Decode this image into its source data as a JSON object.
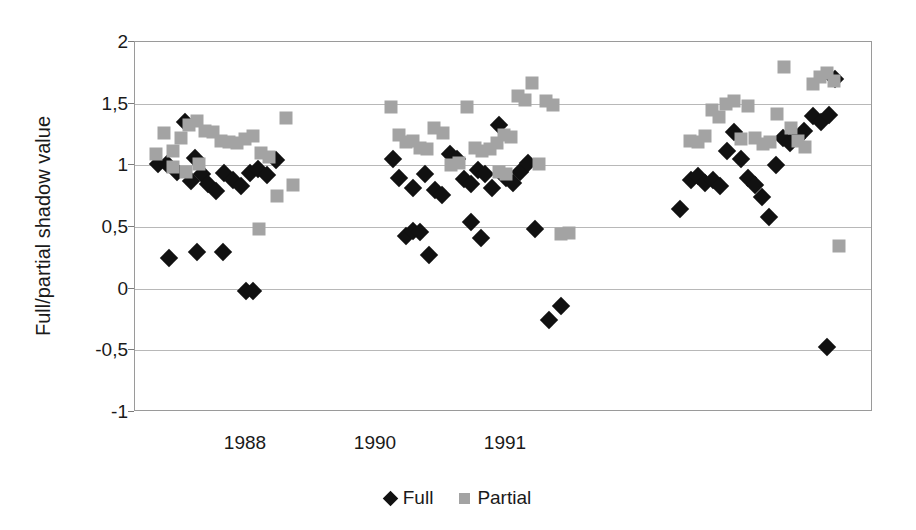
{
  "chart_data": {
    "type": "scatter",
    "title": "",
    "xlabel": "",
    "ylabel": "Full/partial shadow value",
    "ylim": [
      -1,
      2
    ],
    "ytick_labels": [
      "2",
      "1,5",
      "1",
      "0,5",
      "0",
      "-0,5",
      "-1"
    ],
    "ytick_values": [
      2,
      1.5,
      1,
      0.5,
      0,
      -0.5,
      -1
    ],
    "xtick_labels": [
      "1988",
      "1990",
      "1991"
    ],
    "xtick_positions": [
      245,
      375,
      505
    ],
    "grid": true,
    "legend_position": "bottom-center",
    "series": [
      {
        "name": "Full",
        "marker": "diamond",
        "color": "#111111",
        "points": [
          [
            157,
            1.01
          ],
          [
            166,
            1.01
          ],
          [
            176,
            0.95
          ],
          [
            184,
            1.35
          ],
          [
            190,
            0.87
          ],
          [
            194,
            1.06
          ],
          [
            201,
            0.93
          ],
          [
            207,
            0.85
          ],
          [
            215,
            0.79
          ],
          [
            223,
            0.94
          ],
          [
            232,
            0.88
          ],
          [
            240,
            0.83
          ],
          [
            249,
            0.94
          ],
          [
            257,
            0.97
          ],
          [
            266,
            0.92
          ],
          [
            275,
            1.04
          ],
          [
            168,
            0.25
          ],
          [
            196,
            0.3
          ],
          [
            222,
            0.3
          ],
          [
            245,
            -0.02
          ],
          [
            252,
            -0.02
          ],
          [
            392,
            1.05
          ],
          [
            398,
            0.9
          ],
          [
            412,
            0.82
          ],
          [
            424,
            0.93
          ],
          [
            434,
            0.8
          ],
          [
            441,
            0.76
          ],
          [
            449,
            1.09
          ],
          [
            456,
            1.05
          ],
          [
            463,
            0.89
          ],
          [
            470,
            0.85
          ],
          [
            477,
            0.96
          ],
          [
            484,
            0.93
          ],
          [
            491,
            0.82
          ],
          [
            498,
            1.33
          ],
          [
            505,
            0.9
          ],
          [
            512,
            0.86
          ],
          [
            519,
            0.95
          ],
          [
            527,
            1.02
          ],
          [
            534,
            0.48
          ],
          [
            405,
            0.43
          ],
          [
            412,
            0.47
          ],
          [
            419,
            0.46
          ],
          [
            428,
            0.27
          ],
          [
            470,
            0.54
          ],
          [
            480,
            0.41
          ],
          [
            548,
            -0.25
          ],
          [
            560,
            -0.14
          ],
          [
            679,
            0.65
          ],
          [
            690,
            0.88
          ],
          [
            697,
            0.91
          ],
          [
            704,
            0.86
          ],
          [
            712,
            0.88
          ],
          [
            719,
            0.83
          ],
          [
            726,
            1.12
          ],
          [
            733,
            1.27
          ],
          [
            740,
            1.05
          ],
          [
            747,
            0.9
          ],
          [
            754,
            0.84
          ],
          [
            761,
            0.74
          ],
          [
            768,
            0.58
          ],
          [
            775,
            1.0
          ],
          [
            782,
            1.22
          ],
          [
            789,
            1.18
          ],
          [
            796,
            1.22
          ],
          [
            803,
            1.28
          ],
          [
            812,
            1.4
          ],
          [
            820,
            1.35
          ],
          [
            828,
            1.41
          ],
          [
            834,
            1.7
          ],
          [
            826,
            -0.47
          ]
        ]
      },
      {
        "name": "Partial",
        "marker": "square",
        "color": "#a3a3a3",
        "points": [
          [
            155,
            1.09
          ],
          [
            163,
            1.26
          ],
          [
            172,
            1.12
          ],
          [
            180,
            1.22
          ],
          [
            188,
            1.33
          ],
          [
            196,
            1.36
          ],
          [
            204,
            1.28
          ],
          [
            212,
            1.27
          ],
          [
            220,
            1.2
          ],
          [
            228,
            1.19
          ],
          [
            236,
            1.18
          ],
          [
            244,
            1.21
          ],
          [
            252,
            1.24
          ],
          [
            260,
            1.1
          ],
          [
            268,
            1.07
          ],
          [
            276,
            0.75
          ],
          [
            172,
            0.99
          ],
          [
            185,
            0.95
          ],
          [
            198,
            1.01
          ],
          [
            285,
            1.38
          ],
          [
            292,
            0.84
          ],
          [
            258,
            0.48
          ],
          [
            390,
            1.47
          ],
          [
            398,
            1.25
          ],
          [
            405,
            1.19
          ],
          [
            412,
            1.2
          ],
          [
            419,
            1.14
          ],
          [
            426,
            1.13
          ],
          [
            433,
            1.3
          ],
          [
            442,
            1.26
          ],
          [
            450,
            1.0
          ],
          [
            458,
            1.02
          ],
          [
            466,
            1.47
          ],
          [
            474,
            1.14
          ],
          [
            481,
            1.12
          ],
          [
            489,
            1.13
          ],
          [
            496,
            1.18
          ],
          [
            503,
            1.25
          ],
          [
            510,
            1.23
          ],
          [
            517,
            1.56
          ],
          [
            524,
            1.53
          ],
          [
            531,
            1.67
          ],
          [
            538,
            1.01
          ],
          [
            545,
            1.52
          ],
          [
            552,
            1.49
          ],
          [
            498,
            0.95
          ],
          [
            505,
            0.93
          ],
          [
            560,
            0.44
          ],
          [
            568,
            0.45
          ],
          [
            689,
            1.2
          ],
          [
            697,
            1.19
          ],
          [
            704,
            1.24
          ],
          [
            711,
            1.45
          ],
          [
            718,
            1.39
          ],
          [
            725,
            1.5
          ],
          [
            733,
            1.52
          ],
          [
            740,
            1.21
          ],
          [
            747,
            1.48
          ],
          [
            754,
            1.22
          ],
          [
            762,
            1.17
          ],
          [
            769,
            1.19
          ],
          [
            776,
            1.42
          ],
          [
            783,
            1.8
          ],
          [
            790,
            1.3
          ],
          [
            797,
            1.2
          ],
          [
            804,
            1.15
          ],
          [
            812,
            1.66
          ],
          [
            819,
            1.72
          ],
          [
            826,
            1.75
          ],
          [
            833,
            1.68
          ],
          [
            838,
            0.35
          ]
        ]
      }
    ]
  },
  "legend": {
    "items": [
      {
        "label": "Full",
        "marker": "diamond-icon",
        "color": "#111111"
      },
      {
        "label": "Partial",
        "marker": "square-icon",
        "color": "#a3a3a3"
      }
    ]
  }
}
